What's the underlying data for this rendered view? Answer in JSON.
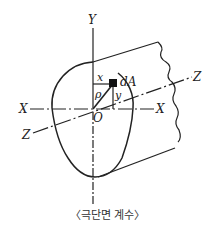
{
  "diagram": {
    "title": "극단면 계수",
    "caption": "〈극단면 계수〉",
    "labels": {
      "y_top": "Y",
      "y_bottom": "Y",
      "x_left": "X",
      "x_right": "X",
      "z_left": "Z",
      "z_right": "Z",
      "origin": "O",
      "dA": "dA",
      "x": "x",
      "y": "y",
      "rho": "ρ"
    },
    "colors": {
      "line": "#222222",
      "element": "#111111",
      "background": "#ffffff"
    }
  }
}
